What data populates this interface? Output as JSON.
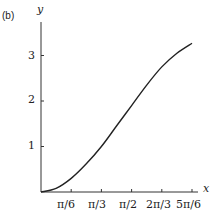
{
  "panel_label": "(b)",
  "chart_data": {
    "type": "line",
    "title": "",
    "xlabel": "x",
    "ylabel": "y",
    "x_tick_labels": [
      "π/6",
      "π/3",
      "π/2",
      "2π/3",
      "5π/6"
    ],
    "y_tick_labels": [
      "1",
      "2",
      "3"
    ],
    "x": [
      0,
      0.2618,
      0.5236,
      0.7854,
      1.0472,
      1.309,
      1.5708,
      1.8326,
      2.0944,
      2.3562,
      2.618
    ],
    "series": [
      {
        "name": "curve",
        "values": [
          0,
          0.08,
          0.3,
          0.62,
          1.0,
          1.45,
          1.9,
          2.35,
          2.75,
          3.05,
          3.27
        ]
      }
    ],
    "xlim": [
      0,
      2.7
    ],
    "ylim": [
      0,
      3.4
    ],
    "grid": false,
    "legend": false
  }
}
